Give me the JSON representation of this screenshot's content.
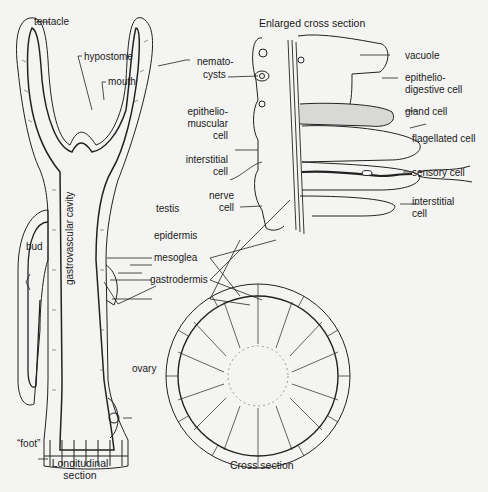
{
  "diagram": {
    "titles": {
      "enlarged": "Enlarged cross section",
      "longitudinal_1": "Longitudinal",
      "longitudinal_2": "section",
      "cross": "Cross section"
    },
    "labels": {
      "tentacle": "tentacle",
      "hypostome": "hypostome",
      "mouth": "mouth",
      "nemato_1": "nemato-",
      "nemato_2": "cysts",
      "epimusc_1": "epithelio-",
      "epimusc_2": "muscular",
      "epimusc_3": "cell",
      "interstitial_l_1": "interstitial",
      "interstitial_l_2": "cell",
      "nerve_1": "nerve",
      "nerve_2": "cell",
      "vacuole": "vacuole",
      "epidig_1": "epithelio-",
      "epidig_2": "digestive cell",
      "gland": "gland  cell",
      "flagellated": "flagellated cell",
      "sensory": "sensory cell",
      "interstitial_r_1": "interstitial",
      "interstitial_r_2": "cell",
      "gvc": "gastrovascular cavity",
      "testis": "testis",
      "bud": "bud",
      "epidermis": "epidermis",
      "mesoglea": "mesoglea",
      "gastrodermis": "gastrodermis",
      "ovary": "ovary",
      "foot": "“foot”"
    }
  }
}
